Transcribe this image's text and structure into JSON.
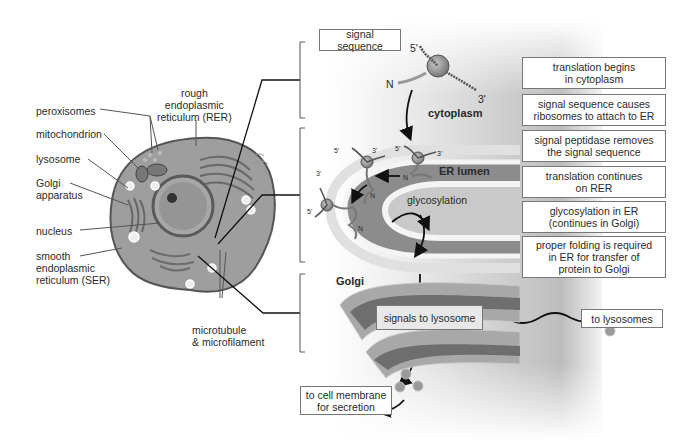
{
  "cell_labels": {
    "rer": "rough\nendoplasmic\nreticulum (RER)",
    "peroxisomes": "peroxisomes",
    "mitochondrion": "mitochondrion",
    "lysosome": "lysosome",
    "golgi_apparatus": "Golgi\napparatus",
    "nucleus": "nucleus",
    "ser": "smooth\nendoplasmic\nreticulum (SER)",
    "microtubule": "microtubule\n& microfilament"
  },
  "pathway": {
    "signal_sequence_box": "signal sequence",
    "five_prime_top": "5'",
    "three_prime_top": "3'",
    "n_terminus_top": "N",
    "cytoplasm": "cytoplasm",
    "er_lumen": "ER lumen",
    "glycosylation": "glycosylation",
    "golgi": "Golgi",
    "signals_to_lysosome": "signals to lysosome",
    "to_lysosomes": "to lysosomes",
    "to_cell_membrane": "to cell membrane\nfor secretion",
    "er_marks": {
      "a5": "5'",
      "a3": "3'",
      "b5": "5'",
      "b3": "3'",
      "c3": "3'",
      "c5": "5'",
      "nA": "N",
      "nB": "N",
      "nC": "N"
    }
  },
  "steps": [
    "translation begins\nin cytoplasm",
    "signal sequence causes\nribosomes to attach to ER",
    "signal peptidase removes\nthe signal sequence",
    "translation continues\non RER",
    "glycosylation in ER\n(continues in Golgi)",
    "proper folding is required\nin ER for transfer of\nprotein to Golgi"
  ],
  "colors": {
    "cell_fill": "#9a9a9a",
    "cell_edge": "#555555",
    "er_lumen": "#8c8c8c",
    "membrane": "#d9d9d9",
    "golgi_outer": "#a8a8a8",
    "golgi_inner": "#707070"
  }
}
